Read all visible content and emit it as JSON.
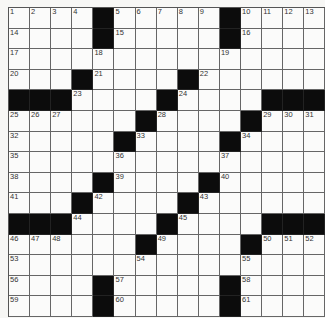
{
  "puzzle": {
    "size": 15,
    "grid": [
      "....#.....#....",
      "....#.....#....",
      "...............",
      "...#....#......",
      "###....#....###",
      "......#....#...",
      ".....#....#....",
      "...............",
      "....#....#.....",
      "...#....#......",
      "###....#....###",
      "......#....#...",
      "...............",
      "....#.....#....",
      "....#.....#...."
    ],
    "numbers": [
      [
        1,
        2,
        3,
        4,
        null,
        5,
        6,
        7,
        8,
        9,
        null,
        10,
        11,
        12,
        13
      ],
      [
        14,
        null,
        null,
        null,
        null,
        15,
        null,
        null,
        null,
        null,
        null,
        16,
        null,
        null,
        null
      ],
      [
        17,
        null,
        null,
        null,
        18,
        null,
        null,
        null,
        null,
        null,
        19,
        null,
        null,
        null,
        null
      ],
      [
        20,
        null,
        null,
        null,
        21,
        null,
        null,
        null,
        null,
        22,
        null,
        null,
        null,
        null,
        null
      ],
      [
        null,
        null,
        null,
        23,
        null,
        null,
        null,
        null,
        24,
        null,
        null,
        null,
        null,
        null,
        null
      ],
      [
        25,
        26,
        27,
        null,
        null,
        null,
        null,
        28,
        null,
        null,
        null,
        null,
        29,
        30,
        31
      ],
      [
        32,
        null,
        null,
        null,
        null,
        null,
        33,
        null,
        null,
        null,
        null,
        34,
        null,
        null,
        null
      ],
      [
        35,
        null,
        null,
        null,
        null,
        36,
        null,
        null,
        null,
        null,
        37,
        null,
        null,
        null,
        null
      ],
      [
        38,
        null,
        null,
        null,
        null,
        39,
        null,
        null,
        null,
        null,
        40,
        null,
        null,
        null,
        null
      ],
      [
        41,
        null,
        null,
        null,
        42,
        null,
        null,
        null,
        null,
        43,
        null,
        null,
        null,
        null,
        null
      ],
      [
        null,
        null,
        null,
        44,
        null,
        null,
        null,
        null,
        45,
        null,
        null,
        null,
        null,
        null,
        null
      ],
      [
        46,
        47,
        48,
        null,
        null,
        null,
        null,
        49,
        null,
        null,
        null,
        null,
        50,
        51,
        52
      ],
      [
        53,
        null,
        null,
        null,
        null,
        null,
        54,
        null,
        null,
        null,
        null,
        55,
        null,
        null,
        null
      ],
      [
        56,
        null,
        null,
        null,
        null,
        57,
        null,
        null,
        null,
        null,
        null,
        58,
        null,
        null,
        null
      ],
      [
        59,
        null,
        null,
        null,
        null,
        60,
        null,
        null,
        null,
        null,
        null,
        61,
        null,
        null,
        null
      ]
    ]
  }
}
